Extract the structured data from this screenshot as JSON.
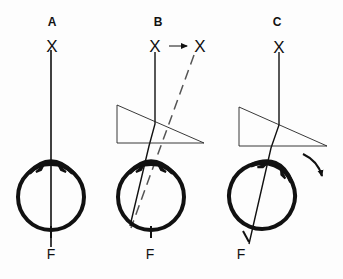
{
  "diagram": {
    "type": "ophthalmology-prism-diagram",
    "colors": {
      "ink": "#111111",
      "background": "#fdfdfd"
    },
    "panels": [
      {
        "id": "A",
        "label": "A",
        "target_label": "X",
        "fovea_label": "F",
        "has_prism": false,
        "description": "Eye fixating target directly; line of sight passes to fovea F"
      },
      {
        "id": "B",
        "label": "B",
        "target_label": "X",
        "displaced_target_label": "X",
        "fovea_label": "F",
        "has_prism": true,
        "description": "Prism in front of eye; image displaced toward apex (dashed line), light falls off fovea"
      },
      {
        "id": "C",
        "label": "C",
        "target_label": "X",
        "fovea_label": "F",
        "has_prism": true,
        "description": "Eye rotates (curved arrow) to bring image back onto fovea F"
      }
    ]
  }
}
